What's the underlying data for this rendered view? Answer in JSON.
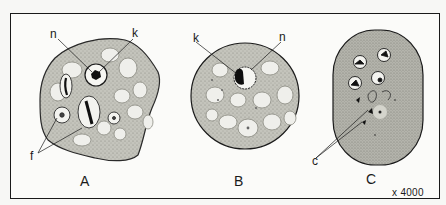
{
  "figure": {
    "magnification": "x 4000",
    "colors": {
      "frame": "#1a1a1a",
      "cytoplasm": "#b8b8b0",
      "vacuole": "#eeeeea",
      "nucleus_dark": "#111111",
      "background": "#fbfbf9"
    },
    "panels": [
      {
        "id": "A",
        "label": "A",
        "annotations": [
          {
            "letter": "n",
            "meaning_pointer": "nucleus"
          },
          {
            "letter": "k",
            "meaning_pointer": "karyosome"
          },
          {
            "letter": "f",
            "meaning_pointer": "food vacuoles"
          }
        ]
      },
      {
        "id": "B",
        "label": "B",
        "annotations": [
          {
            "letter": "k",
            "meaning_pointer": "karyosome"
          },
          {
            "letter": "n",
            "meaning_pointer": "nucleus"
          }
        ]
      },
      {
        "id": "C",
        "label": "C",
        "annotations": [
          {
            "letter": "c",
            "meaning_pointer": "chromatoid bodies"
          }
        ]
      }
    ]
  }
}
